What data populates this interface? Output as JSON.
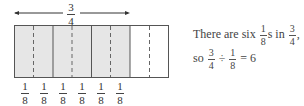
{
  "diagram": {
    "top_label": {
      "numerator": "3",
      "denominator": "4"
    },
    "shaded_color": "#e6e6e6",
    "border_color": "#555555",
    "segments": 8,
    "shaded_segments": 6,
    "bottom_labels": [
      {
        "numerator": "1",
        "denominator": "8"
      },
      {
        "numerator": "1",
        "denominator": "8"
      },
      {
        "numerator": "1",
        "denominator": "8"
      },
      {
        "numerator": "1",
        "denominator": "8"
      },
      {
        "numerator": "1",
        "denominator": "8"
      },
      {
        "numerator": "1",
        "denominator": "8"
      }
    ]
  },
  "explanation": {
    "line1_prefix": "There are six",
    "line1_frac1": {
      "numerator": "1",
      "denominator": "8"
    },
    "line1_mid": "s in",
    "line1_frac2": {
      "numerator": "3",
      "denominator": "4"
    },
    "line1_suffix": ",",
    "line2_prefix": "so",
    "line2_frac1": {
      "numerator": "3",
      "denominator": "4"
    },
    "line2_op": "÷",
    "line2_frac2": {
      "numerator": "1",
      "denominator": "8"
    },
    "line2_result": "= 6"
  }
}
